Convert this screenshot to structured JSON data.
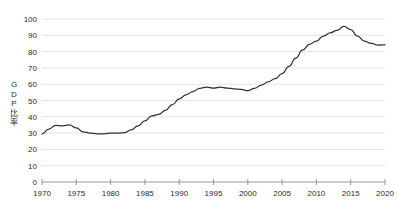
{
  "chart_data": {
    "type": "line",
    "title": "",
    "xlabel": "",
    "ylabel": "GDP比率",
    "ylabel_chars": [
      "G",
      "D",
      "P",
      "比",
      "率"
    ],
    "xlim": [
      1970,
      2020
    ],
    "ylim": [
      0,
      100
    ],
    "grid": true,
    "legend": "none",
    "line_color": "#333333",
    "grid_color": "#d9d9d9",
    "axis_color": "#8c8c8c",
    "text_color": "#2b2b2b",
    "yticks": [
      0,
      10,
      20,
      30,
      40,
      50,
      60,
      70,
      80,
      90,
      100
    ],
    "ytick_labels": [
      "0",
      "10",
      "20",
      "30",
      "40",
      "50",
      "60",
      "70",
      "80",
      "90",
      "100"
    ],
    "xticks": [
      1970,
      1975,
      1980,
      1985,
      1990,
      1995,
      2000,
      2005,
      2010,
      2015,
      2020
    ],
    "xtick_labels": [
      "1970",
      "1975",
      "1980",
      "1985",
      "1990",
      "1995",
      "2000",
      "2005",
      "2010",
      "2015",
      "2020"
    ],
    "series": [
      {
        "name": "GDP比率",
        "x": [
          1970,
          1971,
          1972,
          1973,
          1974,
          1975,
          1976,
          1977,
          1978,
          1979,
          1980,
          1981,
          1982,
          1983,
          1984,
          1985,
          1986,
          1987,
          1988,
          1989,
          1990,
          1991,
          1992,
          1993,
          1994,
          1995,
          1996,
          1997,
          1998,
          1999,
          2000,
          2001,
          2002,
          2003,
          2004,
          2005,
          2006,
          2007,
          2008,
          2009,
          2010,
          2011,
          2012,
          2013,
          2014,
          2015,
          2016,
          2017,
          2018,
          2019,
          2020
        ],
        "values": [
          29.5,
          32.5,
          34.8,
          34.5,
          35.0,
          33.2,
          30.8,
          30.0,
          29.6,
          29.6,
          30.0,
          30.0,
          30.3,
          32.0,
          34.5,
          37.5,
          40.5,
          41.5,
          44.0,
          47.5,
          51.0,
          53.5,
          55.5,
          57.5,
          58.2,
          57.6,
          58.2,
          57.6,
          57.2,
          56.8,
          56.0,
          57.5,
          59.5,
          61.5,
          63.5,
          66.5,
          71.0,
          76.0,
          81.0,
          84.5,
          86.5,
          89.5,
          91.5,
          93.0,
          95.5,
          93.5,
          89.5,
          86.5,
          85.0,
          84.0,
          84.2
        ]
      }
    ],
    "annotations": [
      {
        "label": "peak",
        "x": 2014,
        "y": 95.5
      },
      {
        "label": "final-rise-end",
        "x": 2020,
        "y": 90.8
      }
    ]
  }
}
